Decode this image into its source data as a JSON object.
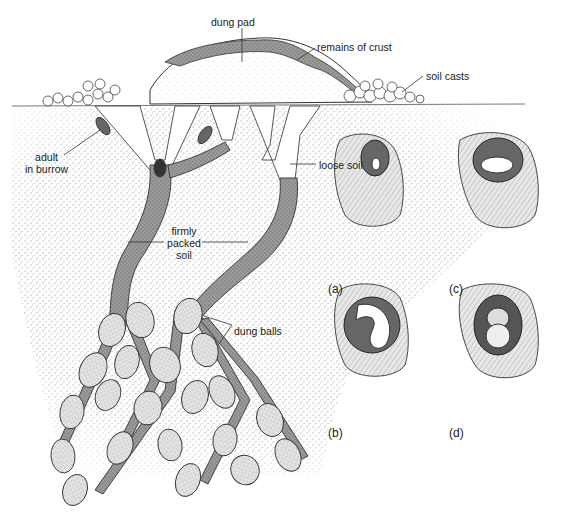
{
  "figure": {
    "labels": {
      "dung_pad": "dung pad",
      "remains_of_crust": "remains of crust",
      "soil_casts": "soil casts",
      "adult_in_burrow_1": "adult",
      "adult_in_burrow_2": "in burrow",
      "loose_soil": "loose soil",
      "firmly_packed_soil_1": "firmly",
      "firmly_packed_soil_2": "packed",
      "firmly_packed_soil_3": "soil",
      "dung_balls": "dung balls"
    },
    "panels": [
      {
        "id": "a",
        "label": "(a)",
        "content": "egg in brood ball"
      },
      {
        "id": "b",
        "label": "(b)",
        "content": "larva in brood ball"
      },
      {
        "id": "c",
        "label": "(c)",
        "content": "pupa in brood ball"
      },
      {
        "id": "d",
        "label": "(d)",
        "content": "adult beetle in brood ball"
      }
    ],
    "colors": {
      "ink": "#222222",
      "soil_stipple": "#bdbdbd",
      "packed_soil": "#8a8a8a",
      "ball_fill": "#d8d8d8",
      "background": "#ffffff"
    }
  }
}
